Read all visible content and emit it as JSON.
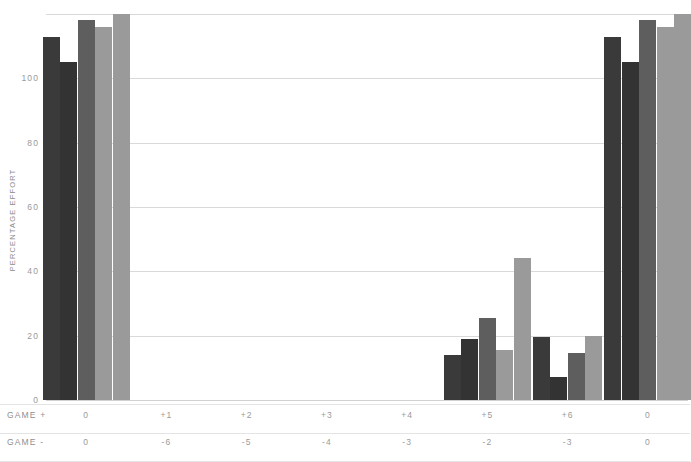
{
  "chart_data": {
    "type": "bar",
    "title": "",
    "subtitle": "",
    "xlabel": "",
    "ylabel": "PERCENTAGE EFFORT",
    "ylim": [
      0,
      120
    ],
    "yticks": [
      0,
      20,
      40,
      60,
      80,
      100
    ],
    "ytick_labels": [
      "0",
      "20",
      "40",
      "60",
      "80",
      "100"
    ],
    "grid": "horizontal",
    "legend": "none",
    "note": "Bars in the first and last groups exceed the plotted axis range and are clipped at the top of the plot area.",
    "categories": [
      "0",
      "+1",
      "+2",
      "+3",
      "+4",
      "+5",
      "+6",
      "0"
    ],
    "category_rows": [
      {
        "label": "GAME +",
        "values": [
          "0",
          "+1",
          "+2",
          "+3",
          "+4",
          "+5",
          "+6",
          "0"
        ]
      },
      {
        "label": "GAME -",
        "values": [
          "0",
          "-6",
          "-5",
          "-4",
          "-3",
          "-2",
          "-3",
          "0"
        ]
      }
    ],
    "series": [
      {
        "name": "series-1",
        "color": "#3a3a3a",
        "values": [
          113,
          null,
          null,
          null,
          null,
          14,
          19.5,
          113
        ]
      },
      {
        "name": "series-2",
        "color": "#333333",
        "values": [
          105,
          null,
          null,
          null,
          null,
          19,
          7,
          105
        ]
      },
      {
        "name": "series-3",
        "color": "#5e5e5e",
        "values": [
          118,
          null,
          null,
          null,
          null,
          25.5,
          14.5,
          118
        ]
      },
      {
        "name": "series-4",
        "color": "#9a9a9a",
        "values": [
          116,
          null,
          null,
          null,
          null,
          15.5,
          20,
          116
        ]
      },
      {
        "name": "series-5",
        "color": "#9a9a9a",
        "values": [
          120,
          null,
          null,
          null,
          null,
          44,
          null,
          120
        ]
      }
    ]
  },
  "colors": {
    "background": "#ffffff",
    "gridline": "#d9d9d9",
    "axis_text": "#9a9a9a",
    "label_text": "#8f8f8f",
    "bar_darkest": "#333333",
    "bar_dark": "#3a3a3a",
    "bar_mid": "#5e5e5e",
    "bar_light": "#9a9a9a"
  }
}
